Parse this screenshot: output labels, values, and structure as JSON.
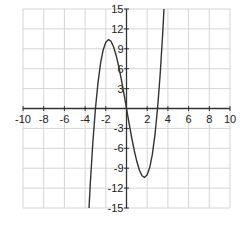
{
  "chart_data": {
    "type": "line",
    "title": "",
    "xlabel": "",
    "ylabel": "",
    "xlim": [
      -10,
      10
    ],
    "ylim": [
      -15,
      15
    ],
    "grid": true,
    "legend": null,
    "x_ticks": [
      -10,
      -8,
      -6,
      -4,
      -2,
      2,
      4,
      6,
      8,
      10
    ],
    "x_tick_labels": [
      "-10",
      "-8",
      "-6",
      "-4",
      "-2",
      "2",
      "4",
      "6",
      "8",
      "10"
    ],
    "y_ticks": [
      15,
      12,
      9,
      6,
      3,
      -3,
      -6,
      -9,
      -12,
      -15
    ],
    "y_tick_labels": [
      "15",
      "12",
      "9",
      "6",
      "3",
      "-3",
      "-6",
      "-9",
      "-12",
      "-15"
    ],
    "series": [
      {
        "name": "f(x) = x^3 - 9x",
        "x": [
          -3.7,
          -3.5,
          -3.25,
          -3.0,
          -2.75,
          -2.5,
          -2.25,
          -2.0,
          -1.73,
          -1.5,
          -1.25,
          -1.0,
          -0.75,
          -0.5,
          -0.25,
          0.0,
          0.25,
          0.5,
          0.75,
          1.0,
          1.25,
          1.5,
          1.73,
          2.0,
          2.25,
          2.5,
          2.75,
          3.0,
          3.25,
          3.5,
          3.7
        ],
        "values": [
          -17.35,
          -11.38,
          -5.08,
          0.0,
          3.95,
          6.88,
          8.86,
          10.0,
          10.39,
          10.13,
          9.3,
          8.0,
          6.33,
          4.38,
          2.23,
          0.0,
          -2.23,
          -4.38,
          -6.33,
          -8.0,
          -9.3,
          -10.13,
          -10.39,
          -10.0,
          -8.86,
          -6.88,
          -3.95,
          0.0,
          5.08,
          11.38,
          17.35
        ]
      }
    ],
    "annotations": []
  },
  "layout": {
    "plot_left": 23,
    "plot_right": 230,
    "plot_top": 9,
    "plot_bottom": 208,
    "grid_color": "#d4d4d4",
    "axis_color": "#333333",
    "curve_color": "#333333"
  }
}
